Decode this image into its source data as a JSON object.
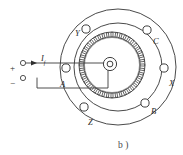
{
  "figure": {
    "caption": "b )"
  },
  "excitation": {
    "positive_terminal_label": "+",
    "negative_terminal_label": "−",
    "current_label": "I",
    "current_subscript": "f"
  },
  "stator_terminals": [
    {
      "id": "Y",
      "label": "Y"
    },
    {
      "id": "C",
      "label": "C"
    },
    {
      "id": "A",
      "label": "A"
    },
    {
      "id": "X",
      "label": "X"
    },
    {
      "id": "Z",
      "label": "Z"
    },
    {
      "id": "B",
      "label": "B"
    }
  ],
  "colors": {
    "line": "#4a4a4a",
    "wire": "#3a3a3a",
    "text": "#2b2b2b",
    "background": "#ffffff"
  }
}
